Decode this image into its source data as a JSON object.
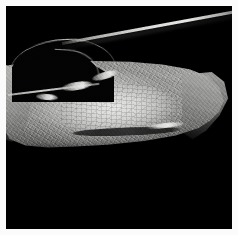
{
  "image": {
    "kind": "photograph",
    "subject": "anatomical specimen section",
    "modality": "grayscale macro photograph",
    "orientation": "landscape within square frame",
    "alt_text": "Grayscale photograph of a longitudinal anatomical specimen section on a black background, showing a pale elongated tissue mass with a bright mottled oval core and a dark curved streak, a dark arched void at the upper left, and a thin bright diagonal band across the upper right.",
    "width_px": 238,
    "height_px": 235
  },
  "frame": {
    "border_color": "#fbfbfb",
    "border_width_px": 6,
    "plate_color": "#000000"
  },
  "palette": {
    "background": "#000000",
    "mount": "#fbfbfb",
    "tissue_mid": "#9c9c9a",
    "tissue_light": "#cdcdcb",
    "core_highlight": "#e8e8e6",
    "streak_dark": "#1e1e1e",
    "ridge_highlight": "#e2e2e0"
  },
  "regions": [
    {
      "id": "tissue-mass",
      "label": "Main tissue mass",
      "description": "Broad pale wedge of tissue spanning the central horizontal band of the plate, brightest near its center and fading into the black field at the lower and outer margins.",
      "tone": "mid gray"
    },
    {
      "id": "oval-core",
      "label": "Bright mottled oval core",
      "description": "Elongated light oval occupying the middle of the tissue mass, filled with fine granular mottling and darker speckles.",
      "tone": "light gray"
    },
    {
      "id": "dark-streak",
      "label": "Dark curved streak",
      "description": "Narrow dark curved band running horizontally through the lower part of the bright oval, with a bright highlight along its upper right rim.",
      "tone": "near black"
    },
    {
      "id": "dark-arch",
      "label": "Dark arched void",
      "description": "Dome-shaped black region at the upper left, bounded above by a thin bright ridge line.",
      "tone": "black"
    },
    {
      "id": "diagonal-band",
      "label": "Bright diagonal band",
      "description": "Thin luminous line crossing the upper right of the plate from lower left to upper right, with a soft dark shadow beneath it.",
      "tone": "bright white-gray"
    },
    {
      "id": "right-taper",
      "label": "Right tissue taper",
      "description": "Tissue narrowing toward the right margin of the plate where it meets the black field.",
      "tone": "mid gray"
    },
    {
      "id": "left-sliver",
      "label": "Left tissue sliver",
      "description": "Strip of tissue reaching the left edge of the plate beneath the dark arch.",
      "tone": "mid gray"
    },
    {
      "id": "blobs",
      "label": "Bright boundary blobs",
      "description": "Small elongated bright spots along the base of the dark arch where it meets the tissue.",
      "tone": "bright gray"
    }
  ]
}
